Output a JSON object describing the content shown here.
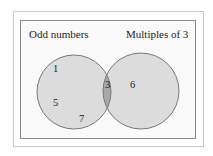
{
  "diagram": {
    "type": "venn",
    "sets": [
      {
        "id": "odd",
        "label": "Odd numbers",
        "only": [
          "1",
          "5",
          "7"
        ]
      },
      {
        "id": "mult3",
        "label": "Multiples of 3",
        "only": [
          "6"
        ]
      }
    ],
    "intersection": [
      "3"
    ],
    "colors": {
      "frame_outer": "#c8c8c8",
      "frame_inner": "#8a8a8a",
      "circle_fill": "#dcdcdc",
      "circle_stroke": "#777777",
      "intersection_fill": "#a9a9a9",
      "text": "#222222"
    }
  },
  "labels": {
    "left_set": "Odd numbers",
    "right_set": "Multiples of 3",
    "n1": "1",
    "n5": "5",
    "n7": "7",
    "n3": "3",
    "n6": "6"
  }
}
